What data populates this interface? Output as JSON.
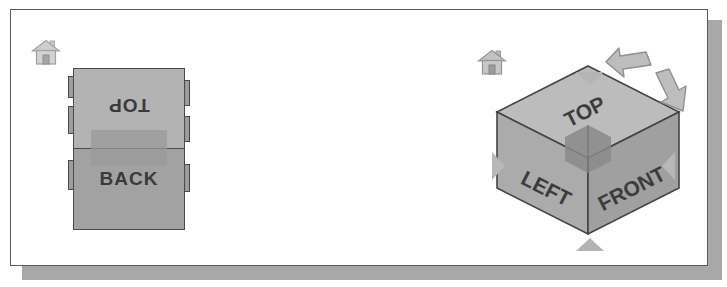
{
  "figure": {
    "background_color": "#ffffff",
    "frame_border_color": "#5a5a5a",
    "shadow_color": "#a8a8a8"
  },
  "panels": [
    {
      "id": "edge-view",
      "name": "viewcube-edge-orientation",
      "home_icon": "home-icon",
      "cube": {
        "type": "edge",
        "faces": [
          {
            "name": "top-face",
            "label": "TOP",
            "rotation_deg": 180,
            "fill": "#b3b3b3"
          },
          {
            "name": "back-face",
            "label": "BACK",
            "rotation_deg": 0,
            "fill": "#a2a2a2"
          }
        ],
        "highlight": {
          "name": "edge-highlight-band",
          "fill": "#9a9a9a"
        }
      }
    },
    {
      "id": "corner-view",
      "name": "viewcube-corner-orientation",
      "home_icon": "home-icon",
      "cube": {
        "type": "corner",
        "faces": [
          {
            "name": "top-face",
            "label": "TOP",
            "fill": "#bcbcbc"
          },
          {
            "name": "left-face",
            "label": "LEFT",
            "fill": "#ababab"
          },
          {
            "name": "front-face",
            "label": "FRONT",
            "fill": "#a0a0a0"
          }
        ],
        "highlight": {
          "name": "corner-highlight",
          "fill": "#8a8a8a"
        }
      }
    },
    {
      "id": "face-view",
      "name": "viewcube-face-orientation",
      "home_icon": "home-icon",
      "cube": {
        "type": "face",
        "faces": [
          {
            "name": "left-face",
            "label": "LEFT",
            "fill": "#b0b0b0"
          }
        ],
        "highlight": {
          "name": "face-hover-highlight",
          "fill": "#8f8f8f"
        }
      },
      "arrows": [
        {
          "name": "arrow-up-icon",
          "direction": "down",
          "position": "top",
          "fill": "#b4b4b4"
        },
        {
          "name": "arrow-down-icon",
          "direction": "up",
          "position": "bottom",
          "fill": "#b4b4b4"
        },
        {
          "name": "arrow-left-icon",
          "direction": "right",
          "position": "left",
          "fill": "#b8b8b8"
        },
        {
          "name": "arrow-right-icon",
          "direction": "left",
          "position": "right",
          "fill": "#b8b8b8"
        },
        {
          "name": "roll-ccw-arrow-icon",
          "direction": "counter-clockwise",
          "position": "top-right",
          "fill": "#bdbdbd"
        },
        {
          "name": "roll-cw-arrow-icon",
          "direction": "clockwise",
          "position": "right",
          "fill": "#bdbdbd"
        }
      ]
    }
  ],
  "labels": {
    "top": "TOP",
    "back": "BACK",
    "left": "LEFT",
    "front": "FRONT"
  }
}
